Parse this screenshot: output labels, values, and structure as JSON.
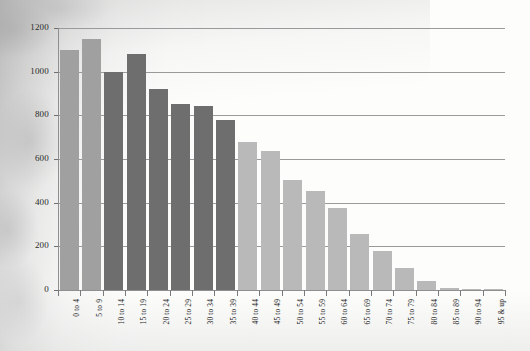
{
  "chart_data": {
    "type": "bar",
    "title": "",
    "subtitle": "",
    "xlabel": "",
    "ylabel": "",
    "legend": [],
    "grid": true,
    "ylim": [
      0,
      1200
    ],
    "yticks": [
      0,
      200,
      400,
      600,
      800,
      1000,
      1200
    ],
    "ytick_labels": [
      "0",
      "200",
      "400",
      "600",
      "800",
      "1000",
      "1200"
    ],
    "categories": [
      "0 to 4",
      "5 to 9",
      "10 to 14",
      "15 to 19",
      "20 to 24",
      "25 to 29",
      "30 to 34",
      "35 to 39",
      "40 to 44",
      "45 to 49",
      "50 to 54",
      "55 to 59",
      "60 to 64",
      "65 to 69",
      "70 to 74",
      "75 to 79",
      "80 to 84",
      "85 to 89",
      "90 to 94",
      "95 & up"
    ],
    "values": [
      1100,
      1150,
      1000,
      1080,
      920,
      850,
      845,
      780,
      680,
      635,
      505,
      455,
      375,
      255,
      180,
      100,
      40,
      8,
      3,
      2
    ],
    "bar_shades": [
      "mid",
      "mid",
      "dark",
      "dark",
      "dark",
      "dark",
      "dark",
      "dark",
      "light",
      "light",
      "light",
      "light",
      "light",
      "light",
      "light",
      "light",
      "light",
      "light",
      "light",
      "light"
    ],
    "colors": {
      "dark": "#6e6e6e",
      "mid": "#a0a0a0",
      "light": "#b9b9b9",
      "gridline": "#9a9a9a",
      "axis": "#8f8f8f",
      "text": "#1e1e1e",
      "background": "#fdfdfc"
    }
  }
}
